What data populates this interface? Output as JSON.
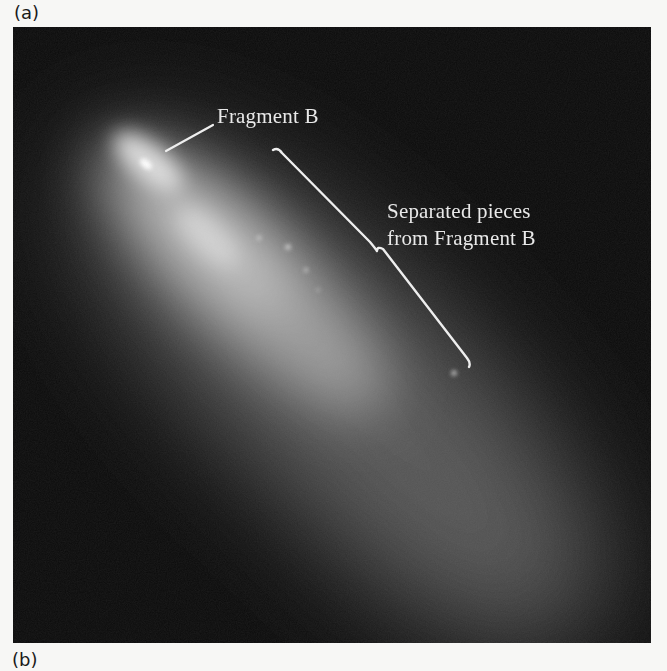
{
  "figure": {
    "panel_a_label": "(a)",
    "panel_b_label": "(b)",
    "photo": {
      "subject": "comet fragment with trailing debris",
      "background_color": "#0b0b0b",
      "glow_color": "#d8d8d8"
    },
    "annotations": {
      "fragment_label": "Fragment B",
      "separated_line1": "Separated pieces",
      "separated_line2": "from Fragment B"
    },
    "annotation_color": "#ececec"
  }
}
